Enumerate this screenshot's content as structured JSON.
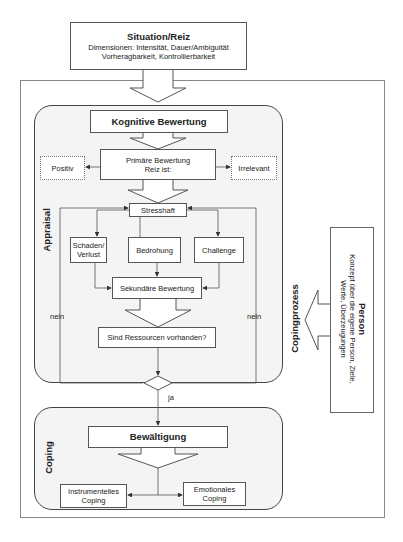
{
  "situation": {
    "title": "Situation/Reiz",
    "line1": "Dimensionen: Intensität, Dauer/Ambiguität",
    "line2": "Vorheragbarkeit, Kontrollierbarkeit"
  },
  "frame_label": "Copingprozess",
  "appraisal": {
    "section_label": "Appraisal",
    "kognitive": "Kognitive Bewertung",
    "positiv": "Positiv",
    "primaer_line1": "Primäre Bewertung",
    "primaer_line2": "Reiz ist:",
    "irrelevant": "Irrelevant",
    "stresshaft": "Stresshaft",
    "schaden_line1": "Schaden/",
    "schaden_line2": "Verlust",
    "bedrohung": "Bedrohung",
    "challenge": "Challenge",
    "sekundaer": "Sekundäre Bewertung",
    "ressourcen": "Sind Ressourcen vorhanden?",
    "nein_left": "nein",
    "nein_right": "nein"
  },
  "decision": {
    "ja": "ja"
  },
  "coping": {
    "section_label": "Coping",
    "bewaeltigung": "Bewältigung",
    "instr_line1": "Instrumentelles",
    "instr_line2": "Coping",
    "emot_line1": "Emotionales",
    "emot_line2": "Coping"
  },
  "person": {
    "title": "Person",
    "line1": "Konzept über die eigene Person, Ziele,",
    "line2": "Werte, Überzeugungen"
  },
  "colors": {
    "line": "#555555",
    "panel_fill": "#f4f4f4",
    "frame": "#888888"
  }
}
